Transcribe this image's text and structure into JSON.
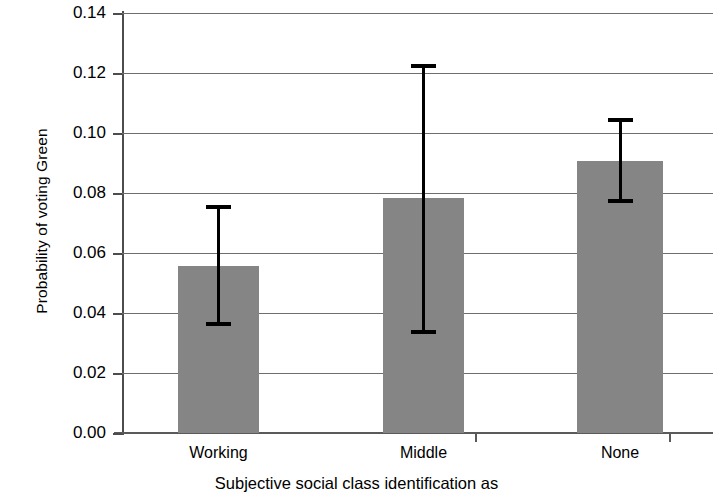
{
  "chart_data": {
    "type": "bar",
    "title": "",
    "xlabel": "Subjective social class identification as",
    "ylabel": "Probability of voting Green",
    "categories": [
      "Working",
      "Middle",
      "None"
    ],
    "values": [
      0.0558,
      0.0785,
      0.0908
    ],
    "error_low": [
      0.0362,
      0.0336,
      0.0775
    ],
    "error_high": [
      0.0753,
      0.1222,
      0.1043
    ],
    "ylim": [
      0.0,
      0.14
    ],
    "ytick_labels": [
      "0.00",
      "0.02",
      "0.04",
      "0.06",
      "0.08",
      "0.10",
      "0.12",
      "0.14"
    ],
    "ytick_values": [
      0.0,
      0.02,
      0.04,
      0.06,
      0.08,
      0.1,
      0.12,
      0.14
    ],
    "grid": true,
    "legend": "none",
    "bar_color": "#858585",
    "errorbar_color": "#000000",
    "axis_color": "#4d4d4d",
    "grid_color": "#6e6e6e"
  }
}
